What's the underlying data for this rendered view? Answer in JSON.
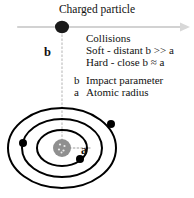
{
  "figure": {
    "title": "Charged particle",
    "labels": {
      "impact_parameter_symbol": "b",
      "atomic_radius_symbol": "a"
    },
    "legend": {
      "heading": "Collisions",
      "soft": "Soft - distant b >> a",
      "hard": "Hard - close b ≈ a",
      "key_b_symbol": "b",
      "key_b_description": "Impact parameter",
      "key_a_symbol": "a",
      "key_a_description": "Atomic radius"
    },
    "colors": {
      "ink": "#111111",
      "particle": "#1a1a1a",
      "nucleus": "#8c8c8c",
      "orbit": "#000000",
      "electron": "#000000",
      "trajectory": "#cfcfcf",
      "guide_dotted": "#c9c9c9",
      "background": "#ffffff"
    },
    "geometry": {
      "trajectory_y": 27,
      "particle_x": 62,
      "particle_rx": 7,
      "particle_ry": 6,
      "atom_center_x": 62,
      "atom_center_y": 148,
      "orbit_radii_x": [
        25,
        40,
        54
      ],
      "orbit_radii_y": [
        18,
        29,
        40
      ],
      "nucleus_radius": 9,
      "electron_count": 3
    },
    "icons": {
      "arrow": "arrow-right-icon",
      "particle": "charged-particle-icon",
      "nucleus": "atomic-nucleus-icon",
      "electron": "electron-icon"
    }
  }
}
